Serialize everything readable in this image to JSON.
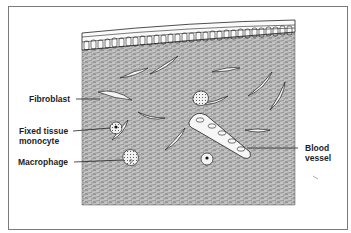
{
  "figure": {
    "labels": {
      "fibroblast": "Fibroblast",
      "fixed_tissue_monocyte_line1": "Fixed tissue",
      "fixed_tissue_monocyte_line2": "monocyte",
      "macrophage": "Macrophage",
      "blood_vessel_line1": "Blood",
      "blood_vessel_line2": "vessel"
    },
    "colors": {
      "frame": "#7a7a7a",
      "ink": "#1e1e1e",
      "tissue_fill": "#b9b9b9",
      "cell_fill": "#f4f4f4"
    }
  }
}
